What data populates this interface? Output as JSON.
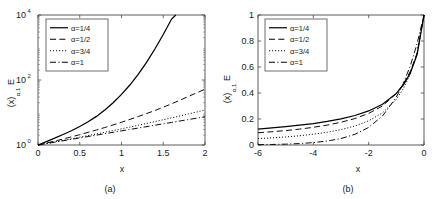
{
  "figure": {
    "background": "#ffffff",
    "curve_color": "#000000",
    "axis_color": "#4a4a4a"
  },
  "chart_data": [
    {
      "type": "line",
      "panel": "a",
      "caption": "(a)",
      "title": "",
      "xlabel": "x",
      "ylabel": "E",
      "ylabel_sub": "α,1",
      "ylabel_arg": "(x)",
      "yscale": "log",
      "xscale": "linear",
      "xlim": [
        0,
        2
      ],
      "ylim": [
        1,
        10000
      ],
      "grid": false,
      "legend_position": "upper left",
      "xticks": [
        0,
        0.5,
        1,
        1.5,
        2
      ],
      "xticklabels": [
        "0",
        "0.5",
        "1",
        "1.5",
        "2"
      ],
      "yticks": [
        1,
        100,
        10000
      ],
      "yticklabels": [
        "10",
        "10",
        "10"
      ],
      "ytickexponents": [
        "0",
        "2",
        "4"
      ],
      "series": [
        {
          "name": "α=1/4",
          "style": "solid",
          "x": [
            0,
            0.1,
            0.2,
            0.3,
            0.4,
            0.5,
            0.6,
            0.7,
            0.8,
            0.9,
            1.0,
            1.1,
            1.2,
            1.3,
            1.4,
            1.5,
            1.6,
            1.65
          ],
          "y": [
            1.0,
            1.27,
            1.62,
            2.1,
            2.75,
            3.7,
            5.2,
            7.6,
            12.0,
            20.0,
            36.0,
            70.0,
            150.0,
            350.0,
            900.0,
            2500.0,
            7500.0,
            10000.0
          ]
        },
        {
          "name": "α=1/2",
          "style": "dashed",
          "x": [
            0,
            0.1,
            0.2,
            0.3,
            0.4,
            0.5,
            0.6,
            0.7,
            0.8,
            0.9,
            1.0,
            1.2,
            1.4,
            1.6,
            1.8,
            2.0
          ],
          "y": [
            1.0,
            1.15,
            1.32,
            1.53,
            1.78,
            2.08,
            2.45,
            2.9,
            3.45,
            4.15,
            5.0,
            7.5,
            11.5,
            18.5,
            31.0,
            52.0
          ]
        },
        {
          "name": "α=3/4",
          "style": "dotted",
          "x": [
            0,
            0.1,
            0.2,
            0.3,
            0.4,
            0.5,
            0.6,
            0.7,
            0.8,
            0.9,
            1.0,
            1.2,
            1.4,
            1.6,
            1.8,
            2.0
          ],
          "y": [
            1.0,
            1.11,
            1.24,
            1.39,
            1.55,
            1.74,
            1.95,
            2.19,
            2.47,
            2.79,
            3.15,
            4.05,
            5.25,
            6.85,
            9.0,
            11.9
          ]
        },
        {
          "name": "α=1",
          "style": "dashdot",
          "x": [
            0,
            0.1,
            0.2,
            0.3,
            0.4,
            0.5,
            0.6,
            0.7,
            0.8,
            0.9,
            1.0,
            1.2,
            1.4,
            1.6,
            1.8,
            2.0
          ],
          "y": [
            1.0,
            1.105,
            1.221,
            1.35,
            1.492,
            1.649,
            1.822,
            2.014,
            2.226,
            2.46,
            2.718,
            3.32,
            4.055,
            4.953,
            6.05,
            7.389
          ]
        }
      ]
    },
    {
      "type": "line",
      "panel": "b",
      "caption": "(b)",
      "title": "",
      "xlabel": "x",
      "ylabel": "E",
      "ylabel_sub": "α,1",
      "ylabel_arg": "(x)",
      "yscale": "linear",
      "xscale": "linear",
      "xlim": [
        -6,
        0
      ],
      "ylim": [
        0,
        1
      ],
      "grid": false,
      "legend_position": "upper left",
      "xticks": [
        -6,
        -4,
        -2,
        0
      ],
      "xticklabels": [
        "-6",
        "-4",
        "-2",
        "0"
      ],
      "yticks": [
        0,
        0.2,
        0.4,
        0.6,
        0.8,
        1
      ],
      "yticklabels": [
        "0",
        "0.2",
        "0.4",
        "0.6",
        "0.8",
        "1"
      ],
      "series": [
        {
          "name": "α=1/4",
          "style": "solid",
          "x": [
            -6,
            -5.5,
            -5,
            -4.5,
            -4,
            -3.5,
            -3,
            -2.5,
            -2,
            -1.5,
            -1,
            -0.75,
            -0.5,
            -0.25,
            0
          ],
          "y": [
            0.123,
            0.131,
            0.141,
            0.152,
            0.165,
            0.181,
            0.201,
            0.227,
            0.262,
            0.313,
            0.397,
            0.461,
            0.551,
            0.695,
            1.0
          ]
        },
        {
          "name": "α=1/2",
          "style": "dashed",
          "x": [
            -6,
            -5.5,
            -5,
            -4.5,
            -4,
            -3.5,
            -3,
            -2.5,
            -2,
            -1.5,
            -1,
            -0.75,
            -0.5,
            -0.25,
            0
          ],
          "y": [
            0.094,
            0.102,
            0.111,
            0.122,
            0.136,
            0.153,
            0.175,
            0.203,
            0.243,
            0.3,
            0.396,
            0.468,
            0.564,
            0.706,
            1.0
          ]
        },
        {
          "name": "α=3/4",
          "style": "dotted",
          "x": [
            -6,
            -5.5,
            -5,
            -4.5,
            -4,
            -3.5,
            -3,
            -2.5,
            -2,
            -1.5,
            -1,
            -0.75,
            -0.5,
            -0.25,
            0
          ],
          "y": [
            0.049,
            0.055,
            0.062,
            0.071,
            0.083,
            0.098,
            0.118,
            0.146,
            0.186,
            0.247,
            0.351,
            0.432,
            0.543,
            0.702,
            1.0
          ]
        },
        {
          "name": "α=1",
          "style": "dashdot",
          "x": [
            -6,
            -5.5,
            -5,
            -4.5,
            -4,
            -3.5,
            -3,
            -2.5,
            -2,
            -1.5,
            -1,
            -0.75,
            -0.5,
            -0.25,
            0
          ],
          "y": [
            0.0025,
            0.0041,
            0.0067,
            0.0111,
            0.0183,
            0.0302,
            0.0498,
            0.0821,
            0.1353,
            0.2231,
            0.3679,
            0.4724,
            0.6065,
            0.7788,
            1.0
          ]
        }
      ]
    }
  ]
}
